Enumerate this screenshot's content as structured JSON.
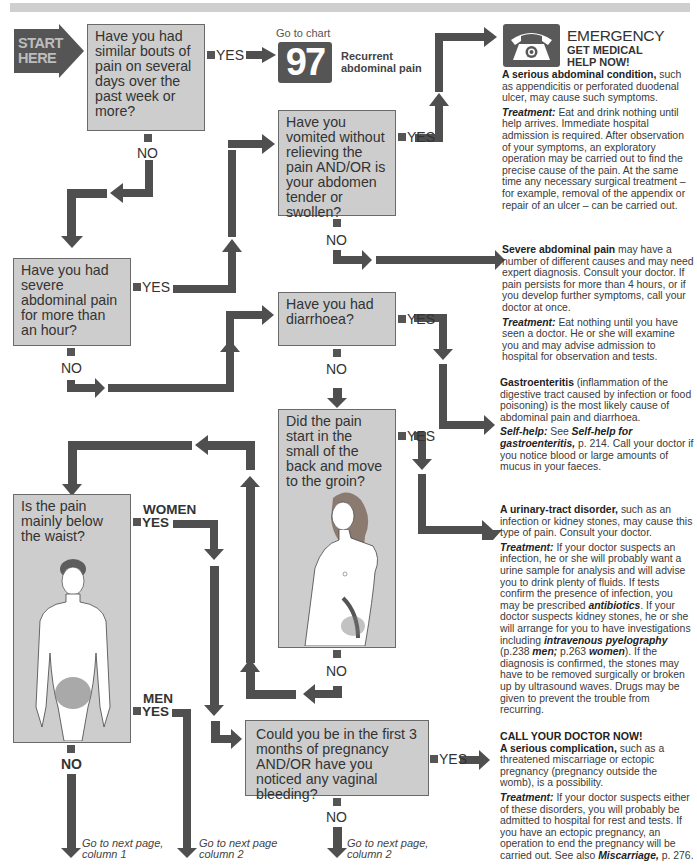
{
  "header": {
    "title_bar": ""
  },
  "start": {
    "label_line1": "START",
    "label_line2": "HERE"
  },
  "questions": [
    {
      "id": "q1",
      "text": "Have you had similar bouts of pain on several days over the past week or more?"
    },
    {
      "id": "q2",
      "text": "Have you vomited without relieving the pain AND/OR is your abdomen tender or swollen?"
    },
    {
      "id": "q3",
      "text": "Have you had severe abdominal pain for more than an hour?"
    },
    {
      "id": "q4",
      "text": "Have you had diarrhoea?"
    },
    {
      "id": "q5",
      "text": "Did the pain start in the small of the back and move to the groin?"
    },
    {
      "id": "q6",
      "text": "Is the pain mainly below the waist?"
    },
    {
      "id": "q7",
      "text": "Could you be in the first 3 months of pregnancy AND/OR have you noticed any vaginal bleeding?"
    }
  ],
  "labels": {
    "yes": "YES",
    "no": "NO",
    "women": "WOMEN",
    "men": "MEN"
  },
  "chart_ref": {
    "go_to": "Go to chart",
    "number": "97",
    "title_line1": "Recurrent",
    "title_line2": "abdominal pain"
  },
  "emergency": {
    "icon": "telephone-icon",
    "title": "EMERGENCY",
    "subtitle_line1": "GET MEDICAL",
    "subtitle_line2": "HELP NOW!"
  },
  "outcomes": {
    "serious_condition": {
      "heading": "A serious abdominal condition,",
      "body": " such as appendicitis or perforated duodenal ulcer, may cause such symptoms.",
      "treatment_label": "Treatment:",
      "treatment": " Eat and drink nothing until help arrives. Immediate hospital admission is required. After observation of your symptoms, an exploratory operation may be carried out to find the precise cause of the pain. At the same time any necessary surgical treatment – for example, removal of the appendix or repair of an ulcer – can be carried out."
    },
    "severe_pain": {
      "heading": "Severe abdominal pain",
      "body": " may have a number of different causes and may need expert diagnosis. Consult your doctor. If pain persists for more than 4 hours, or if you develop further symptoms, call your doctor at once.",
      "treatment_label": "Treatment:",
      "treatment": " Eat nothing until you have seen a doctor. He or she will examine you and may advise admission to hospital for observation and tests."
    },
    "gastroenteritis": {
      "heading": "Gastroenteritis",
      "body": " (inflammation of the digestive tract caused by infection or food poisoning) is the most likely cause of abdominal pain and diarrhoea.",
      "selfhelp_label": "Self-help:",
      "selfhelp_pre": " See ",
      "selfhelp_ref": "Self-help for gastroenteritis,",
      "selfhelp_post": " p. 214. Call your doctor if you notice blood or large amounts of mucus in your faeces."
    },
    "urinary": {
      "heading": "A urinary-tract disorder,",
      "body": " such as an infection or kidney stones, may cause this type of pain. Consult your doctor.",
      "treatment_label": "Treatment:",
      "treatment_a": " If your doctor suspects an infection, he or she will probably want a urine sample for analysis and will advise you to drink plenty of fluids. If tests confirm the presence of infection, you may be prescribed ",
      "antibiotics": "antibiotics",
      "treatment_b": ". If your doctor suspects kidney stones, he or she will arrange for you to have investigations including ",
      "ivp": "intravenous pyelography",
      "treatment_c": " (p.238 ",
      "men": "men;",
      "treatment_d": " p.263 ",
      "women": "women",
      "treatment_e": "). If the diagnosis is confirmed, the stones may have to be removed surgically or broken up by ultrasound waves. Drugs may be given to prevent the trouble from recurring."
    },
    "pregnancy": {
      "alert": "CALL YOUR DOCTOR NOW!",
      "heading": "A serious complication,",
      "body": " such as a threatened miscarriage or ectopic pregnancy (pregnancy outside the womb), is a possibility.",
      "treatment_label": "Treatment:",
      "treatment": " If your doctor suspects either of these disorders, you will probably be admitted to hospital for rest and tests. If you have an ectopic pregnancy, an operation to end the pregnancy will be carried out. See also ",
      "ref": "Miscarriage,",
      "ref_post": " p. 276."
    }
  },
  "continuations": [
    {
      "line1": "Go to next page,",
      "line2": "column 1"
    },
    {
      "line1": "Go to next page",
      "line2": "column 2"
    },
    {
      "line1": "Go to next page,",
      "line2": "column 2"
    }
  ],
  "colors": {
    "box_fill": "#cdcdcd",
    "box_border": "#6a6a6a",
    "arrow": "#4f4f4f",
    "chart_number_bg": "#555555",
    "start_arrow": "#555555"
  }
}
